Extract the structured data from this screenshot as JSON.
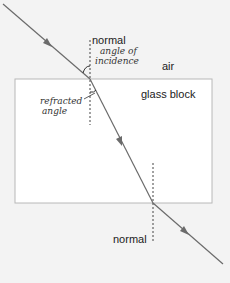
{
  "diagram": {
    "labels": {
      "normal_top": "normal",
      "normal_bottom": "normal",
      "air": "air",
      "glass_block": "glass block"
    },
    "annotations": {
      "angle_of_incidence_line1": "angle of",
      "angle_of_incidence_line2": "incidence",
      "refracted_angle_line1": "refracted",
      "refracted_angle_line2": "angle"
    },
    "colors": {
      "background": "#f3f3f3",
      "block_fill": "#ffffff",
      "block_border": "#b8b8b8",
      "ray": "#6b6b6b",
      "normal": "#444444"
    },
    "geometry": {
      "block": {
        "x": 15,
        "y": 79,
        "width": 197,
        "height": 124
      },
      "incident_ray": {
        "x1": 3,
        "y1": 4,
        "x2": 90,
        "y2": 79
      },
      "refracted_ray": {
        "x1": 90,
        "y1": 79,
        "x2": 153,
        "y2": 203
      },
      "emergent_ray": {
        "x1": 153,
        "y1": 203,
        "x2": 223,
        "y2": 264
      },
      "normal_top": {
        "x": 90,
        "y1": 40,
        "y2": 125
      },
      "normal_bottom": {
        "x": 153,
        "y1": 163,
        "y2": 243
      }
    }
  }
}
